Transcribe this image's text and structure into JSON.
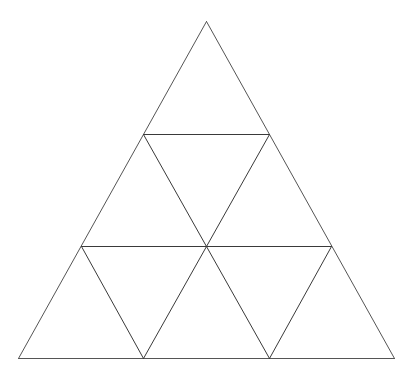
{
  "diagram": {
    "type": "triangle-subdivision",
    "rows": 3,
    "small_triangle_count": 9,
    "stroke_color": "#555555",
    "background": "#ffffff",
    "vertices": {
      "apex": [
        206,
        21
      ],
      "r1_left": [
        143,
        134
      ],
      "r1_right": [
        269,
        134
      ],
      "r2_left": [
        81,
        246
      ],
      "r2_mid": [
        206,
        246
      ],
      "r2_right": [
        331,
        246
      ],
      "base_left": [
        18,
        358
      ],
      "base_m1": [
        143,
        358
      ],
      "base_m2": [
        269,
        358
      ],
      "base_right": [
        394,
        358
      ]
    },
    "edges": [
      {
        "name": "outer-left-edge",
        "from": "apex",
        "to": "base_left",
        "kind": "outer"
      },
      {
        "name": "outer-right-edge",
        "from": "apex",
        "to": "base_right",
        "kind": "outer"
      },
      {
        "name": "outer-base-edge",
        "from": "base_left",
        "to": "base_right",
        "kind": "outer"
      },
      {
        "name": "row1-horizontal",
        "from": "r1_left",
        "to": "r1_right",
        "kind": "inner"
      },
      {
        "name": "row2-horizontal",
        "from": "r2_left",
        "to": "r2_right",
        "kind": "inner"
      },
      {
        "name": "inner-diag-r1left-r2mid",
        "from": "r1_left",
        "to": "r2_mid",
        "kind": "inner"
      },
      {
        "name": "inner-diag-r1right-r2mid",
        "from": "r1_right",
        "to": "r2_mid",
        "kind": "inner"
      },
      {
        "name": "inner-diag-r2left-basem1",
        "from": "r2_left",
        "to": "base_m1",
        "kind": "inner"
      },
      {
        "name": "inner-diag-r2mid-basem1",
        "from": "r2_mid",
        "to": "base_m1",
        "kind": "inner"
      },
      {
        "name": "inner-diag-r2mid-basem2",
        "from": "r2_mid",
        "to": "base_m2",
        "kind": "inner"
      },
      {
        "name": "inner-diag-r2right-basem2",
        "from": "r2_right",
        "to": "base_m2",
        "kind": "inner"
      }
    ]
  }
}
